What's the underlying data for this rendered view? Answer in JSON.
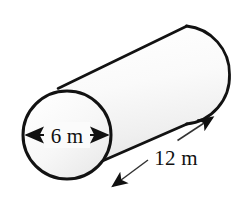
{
  "figure": {
    "name": "cylinder-diagram",
    "shape": "cylinder",
    "background_color": "#ffffff",
    "outline_color": "#121212",
    "body_fill_light": "#ffffff",
    "body_fill_dark": "#e6e6e6",
    "circle_fill_light": "#fdfdfd",
    "circle_fill_dark": "#ebebeb"
  },
  "labels": {
    "diameter": {
      "text": "6 m",
      "value": 6,
      "unit": "m",
      "measures": "diameter",
      "arrow_style": "double-headed"
    },
    "length": {
      "text": "12 m",
      "value": 12,
      "unit": "m",
      "measures": "length",
      "arrow_style": "double-headed"
    }
  },
  "icons": {
    "arrow_left": "arrow-left-icon",
    "arrow_right": "arrow-right-icon",
    "arrow_up_right": "arrow-up-right-icon",
    "arrow_down_left": "arrow-down-left-icon"
  }
}
